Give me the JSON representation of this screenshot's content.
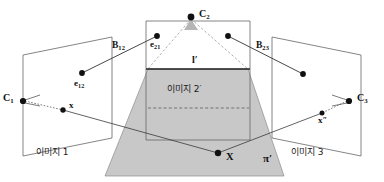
{
  "figure": {
    "background_color": "#ffffff",
    "line_color": "#555555",
    "ray_color": "#333333",
    "plane_fill_color": "#c8c8c8",
    "text_color": "#111111"
  },
  "labels": {
    "camera_1": "C",
    "camera_1_sub": "1",
    "camera_2": "C",
    "camera_2_sub": "2",
    "camera_3": "C",
    "camera_3_sub": "3",
    "epipole_12": "e",
    "epipole_12_sub": "12",
    "epipole_21": "e",
    "epipole_21_sub": "21",
    "baseline_12": "B",
    "baseline_12_sub": "12",
    "baseline_23": "B",
    "baseline_23_sub": "23",
    "point_x_lower": "x",
    "point_x_double_prime": "x",
    "point_x_double_prime_mark": "″",
    "point_X_world": "X",
    "line_l_prime": "l",
    "line_l_prime_mark": "′",
    "plane_pi": "π",
    "plane_pi_prime_mark": "′",
    "image_1": "이미지 1",
    "image_2_prime": "이미지 2",
    "image_2_prime_mark": "′",
    "image_3": "이미지 3"
  },
  "geometry": {
    "left_plane_points": "23,55 112,37 112,138 23,156",
    "right_plane_points": "272,37 361,55 361,156 272,138",
    "center_rect_points": "146,21 250,21 250,140 146,140",
    "projection_plane_points": "105,176 284,176 248,69 148,69",
    "cone_left": "191,17 148,69",
    "cone_right": "191,17 248,69",
    "l_prime_line": "146,69 250,69",
    "dashed_inner_line": "148,108 249,108"
  },
  "points": {
    "C1": {
      "x": 23,
      "y": 101
    },
    "C2": {
      "x": 191,
      "y": 17
    },
    "C3": {
      "x": 349,
      "y": 101
    },
    "e12": {
      "x": 82,
      "y": 73
    },
    "e21": {
      "x": 157,
      "y": 36
    },
    "e23_right": {
      "x": 228,
      "y": 36
    },
    "e32_right": {
      "x": 303,
      "y": 74
    },
    "x_left": {
      "x": 63,
      "y": 110
    },
    "x_right": {
      "x": 322,
      "y": 113
    },
    "X_world": {
      "x": 218,
      "y": 153
    }
  }
}
